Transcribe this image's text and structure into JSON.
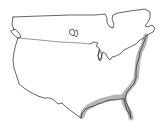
{
  "map": {
    "title": "Range map",
    "region": "United States and southern Canada",
    "colors": {
      "background": "#ffffff",
      "outline": "#222222",
      "range_fill": "#9a9a9a"
    },
    "highlighted_range": {
      "label": "Atlantic and Gulf coastal range",
      "description": "Shaded band along the Atlantic coast from New England south through Florida and west along the Gulf of Mexico coast to Texas"
    }
  }
}
